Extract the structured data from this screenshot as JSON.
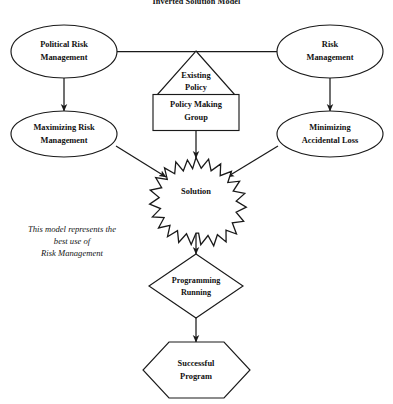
{
  "title": "Inverted Solution Model",
  "nodes": {
    "political_risk": {
      "line1": "Political Risk",
      "line2": "Management"
    },
    "risk_mgmt": {
      "line1": "Risk",
      "line2": "Management"
    },
    "existing_policy": {
      "line1": "Existing",
      "line2": "Policy"
    },
    "policy_making_group": {
      "line1": "Policy Making",
      "line2": "Group"
    },
    "maximizing_risk": {
      "line1": "Maximizing Risk",
      "line2": "Management"
    },
    "minimizing_loss": {
      "line1": "Minimizing",
      "line2": "Accidental Loss"
    },
    "solution": {
      "line1": "Solution"
    },
    "programming_running": {
      "line1": "Programming",
      "line2": "Running"
    },
    "successful_program": {
      "line1": "Successful",
      "line2": "Program"
    }
  },
  "note": {
    "line1": "This model represents the",
    "line2": "best use of",
    "line3": "Risk Management"
  },
  "colors": {
    "stroke": "#1a1a1a",
    "fill": "#ffffff",
    "text": "#111111",
    "background": "#ffffff"
  }
}
